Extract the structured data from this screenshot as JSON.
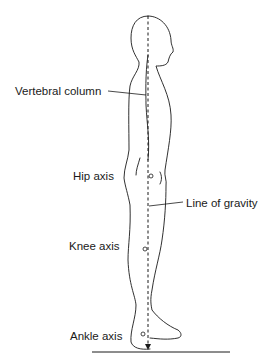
{
  "figure": {
    "type": "posture-line-of-gravity",
    "labels": {
      "vertebral_column": "Vertebral column",
      "hip_axis": "Hip axis",
      "line_of_gravity": "Line of gravity",
      "knee_axis": "Knee axis",
      "ankle_axis": "Ankle axis"
    },
    "colors": {
      "stroke": "#1a1a1a",
      "background": "#ffffff"
    }
  }
}
